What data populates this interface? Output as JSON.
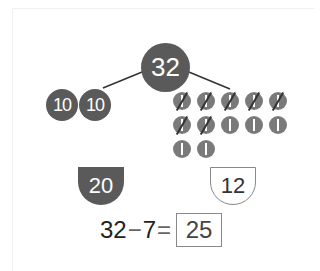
{
  "whole": "32",
  "tens": [
    "10",
    "10"
  ],
  "ones": {
    "total": 12,
    "crossed": 7,
    "glyph": "1"
  },
  "parts": {
    "tens_total": "20",
    "ones_total": "12"
  },
  "equation": {
    "a": "32",
    "op": "−",
    "b": "7",
    "eq": "=",
    "answer": "25"
  },
  "colors": {
    "dark": "#5a5a5a",
    "ones": "#7a7a7a",
    "line": "#333333"
  }
}
